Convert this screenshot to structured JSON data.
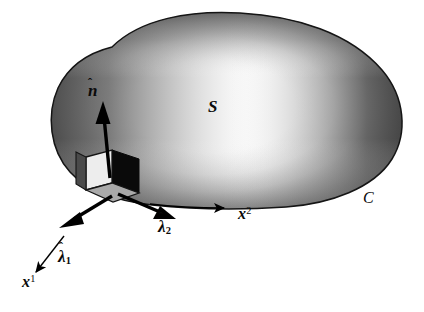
{
  "figure": {
    "background_color": "#ffffff",
    "width": 424,
    "height": 312
  },
  "surface": {
    "name": "S",
    "label": "S",
    "boundary_label": "C",
    "outline_color": "#1a1a1a",
    "highlight_color": "#ffffff",
    "shade_color": "#4d4d4d",
    "dark_edge_color": "#3c3c3c"
  },
  "vectors": {
    "normal": {
      "label": "n̂",
      "symbol": "n",
      "accent": "hat",
      "style": "thick",
      "color": "#000000"
    },
    "tangent_1": {
      "label": "λ̂1",
      "symbol": "λ",
      "accent": "hat",
      "subscript": "1",
      "style": "thick",
      "color": "#000000"
    },
    "tangent_2": {
      "label": "λ̂2",
      "symbol": "λ",
      "accent": "hat",
      "subscript": "2",
      "style": "thick",
      "color": "#000000"
    },
    "coord_1": {
      "label": "x1",
      "symbol": "x",
      "superscript": "1",
      "style": "thin",
      "color": "#000000"
    },
    "coord_2": {
      "label": "x2",
      "symbol": "x",
      "superscript": "2",
      "style": "thin",
      "color": "#000000"
    }
  },
  "element": {
    "name": "surface-element-box",
    "face_light_color": "#e8e8e8",
    "face_dark_color": "#0a0a0a",
    "face_mid_color": "#a8a8a8",
    "edge_color": "#111111"
  },
  "labels": {
    "normal": "n",
    "normal_hat": "̂",
    "surface": "S",
    "curve": "C",
    "lambda": "λ",
    "lambda_1_sub": "1",
    "lambda_2_sub": "2",
    "x": "x",
    "x_1_sup": "1",
    "x_2_sup": "2"
  }
}
